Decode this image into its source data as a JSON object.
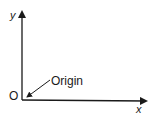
{
  "diagram": {
    "type": "coordinate-axes",
    "y_axis_label": "y",
    "x_axis_label": "x",
    "origin_letter": "O",
    "origin_callout": "Origin",
    "colors": {
      "stroke": "#1a1a1a",
      "background": "#ffffff"
    }
  }
}
